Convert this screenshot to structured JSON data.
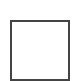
{
  "checkbox": {
    "state": "unchecked",
    "border_color": "#444444",
    "fill_color": "#ffffff"
  }
}
